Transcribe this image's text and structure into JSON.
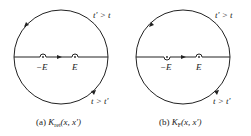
{
  "panels": [
    {
      "id": "a",
      "caption_prefix": "(a) ",
      "caption_symbol": "K",
      "caption_sub": "ret",
      "caption_args": "(x, x′)",
      "upper_label": "t′ > t",
      "lower_label": "t > t′",
      "pole_left": "−E",
      "pole_right": "E"
    },
    {
      "id": "b",
      "caption_prefix": "(b) ",
      "caption_symbol": "K",
      "caption_sub": "F",
      "caption_args": "(x, x′)",
      "upper_label": "t′ > t",
      "lower_label": "t > t′",
      "pole_left": "−E",
      "pole_right": "E"
    }
  ],
  "colors": {
    "stroke": "#222222",
    "background": "#ffffff"
  }
}
